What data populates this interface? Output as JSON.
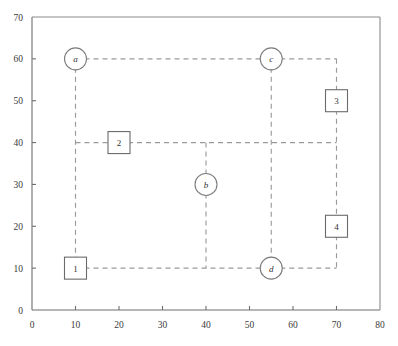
{
  "chart_data": {
    "type": "scatter",
    "title": "",
    "xlabel": "",
    "ylabel": "",
    "xlim": [
      0,
      80
    ],
    "ylim": [
      0,
      70
    ],
    "xticks": [
      0,
      10,
      20,
      30,
      40,
      50,
      60,
      70,
      80
    ],
    "yticks": [
      0,
      10,
      20,
      30,
      40,
      50,
      60,
      70
    ],
    "xtick_labels": [
      "0",
      "10",
      "20",
      "30",
      "40",
      "50",
      "60",
      "70",
      "80"
    ],
    "ytick_labels": [
      "0",
      "10",
      "20",
      "30",
      "40",
      "50",
      "60",
      "70"
    ],
    "grid": false,
    "legend": "none",
    "nodes": [
      {
        "label": "a",
        "shape": "circle",
        "x": 10,
        "y": 60
      },
      {
        "label": "b",
        "shape": "circle",
        "x": 40,
        "y": 30
      },
      {
        "label": "c",
        "shape": "circle",
        "x": 55,
        "y": 60
      },
      {
        "label": "d",
        "shape": "circle",
        "x": 55,
        "y": 10
      },
      {
        "label": "1",
        "shape": "square",
        "x": 10,
        "y": 10
      },
      {
        "label": "2",
        "shape": "square",
        "x": 20,
        "y": 40
      },
      {
        "label": "3",
        "shape": "square",
        "x": 70,
        "y": 50
      },
      {
        "label": "4",
        "shape": "square",
        "x": 70,
        "y": 20
      }
    ],
    "edges": [
      {
        "name": "a-to-c",
        "points": [
          [
            10,
            60
          ],
          [
            55,
            60
          ]
        ]
      },
      {
        "name": "c-to-corner-70-60",
        "points": [
          [
            55,
            60
          ],
          [
            70,
            60
          ]
        ]
      },
      {
        "name": "corner-70-60-down-to-3",
        "points": [
          [
            70,
            60
          ],
          [
            70,
            50
          ]
        ]
      },
      {
        "name": "a-down-to-1",
        "points": [
          [
            10,
            60
          ],
          [
            10,
            10
          ]
        ]
      },
      {
        "name": "y40-from-10-to-2",
        "points": [
          [
            10,
            40
          ],
          [
            20,
            40
          ]
        ]
      },
      {
        "name": "y40-from-2-to-70",
        "points": [
          [
            20,
            40
          ],
          [
            70,
            40
          ]
        ]
      },
      {
        "name": "box3-down-to-box4",
        "points": [
          [
            70,
            50
          ],
          [
            70,
            20
          ]
        ]
      },
      {
        "name": "box4-down-to-y10",
        "points": [
          [
            70,
            20
          ],
          [
            70,
            10
          ]
        ]
      },
      {
        "name": "c-down-to-d",
        "points": [
          [
            55,
            60
          ],
          [
            55,
            10
          ]
        ]
      },
      {
        "name": "x40-from-y40-to-b",
        "points": [
          [
            40,
            40
          ],
          [
            40,
            30
          ]
        ]
      },
      {
        "name": "b-down-to-y10",
        "points": [
          [
            40,
            30
          ],
          [
            40,
            10
          ]
        ]
      },
      {
        "name": "y10-from-1-to-d",
        "points": [
          [
            10,
            10
          ],
          [
            55,
            10
          ]
        ]
      },
      {
        "name": "y10-from-d-to-70",
        "points": [
          [
            55,
            10
          ],
          [
            70,
            10
          ]
        ]
      }
    ],
    "styles": {
      "edge_color": "#9a9a9a",
      "node_stroke": "#7d7d7d",
      "box_stroke": "#6b6b6b",
      "node_fill": "#ffffff",
      "axis_color": "#6e6e6e",
      "frame_color": "#8a8a8a",
      "background": "#ffffff"
    },
    "geometry": {
      "plot_left": 32,
      "plot_right": 380,
      "plot_top": 17,
      "plot_bottom": 310,
      "circle_radius": 11,
      "square_half": 11
    }
  }
}
